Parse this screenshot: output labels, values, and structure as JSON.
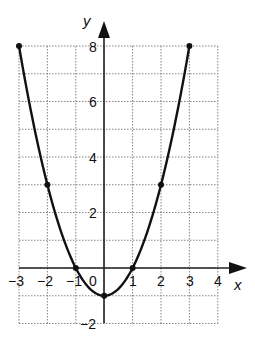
{
  "chart_data": {
    "type": "line",
    "title": "",
    "xlabel": "x",
    "ylabel": "y",
    "xlim": [
      -3,
      4
    ],
    "ylim": [
      -2,
      8
    ],
    "grid": true,
    "x_ticks": [
      "-3",
      "-2",
      "-1",
      "0",
      "1",
      "2",
      "3",
      "4"
    ],
    "y_ticks": [
      "8",
      "6",
      "4",
      "2",
      "-2"
    ],
    "function": "y = x^2 - 1",
    "series": [
      {
        "name": "parabola",
        "x": [
          -3,
          -2,
          -1,
          0,
          1,
          2,
          3
        ],
        "y": [
          8,
          3,
          0,
          -1,
          0,
          3,
          8
        ],
        "marked_points": [
          [
            -3,
            8
          ],
          [
            -2,
            3
          ],
          [
            -1,
            0
          ],
          [
            0,
            -1
          ],
          [
            1,
            0
          ],
          [
            2,
            3
          ],
          [
            3,
            8
          ]
        ]
      }
    ]
  },
  "labels": {
    "x_axis": "x",
    "y_axis": "y",
    "x_tick_labels": [
      "−3",
      "−2",
      "−1",
      "0",
      "1",
      "2",
      "3",
      "4"
    ],
    "y_tick_labels": {
      "8": "8",
      "6": "6",
      "4": "4",
      "2": "2",
      "neg2": "−2"
    }
  },
  "colors": {
    "curve": "#111111",
    "grid": "#777777",
    "axis": "#222222",
    "background": "#ffffff"
  }
}
